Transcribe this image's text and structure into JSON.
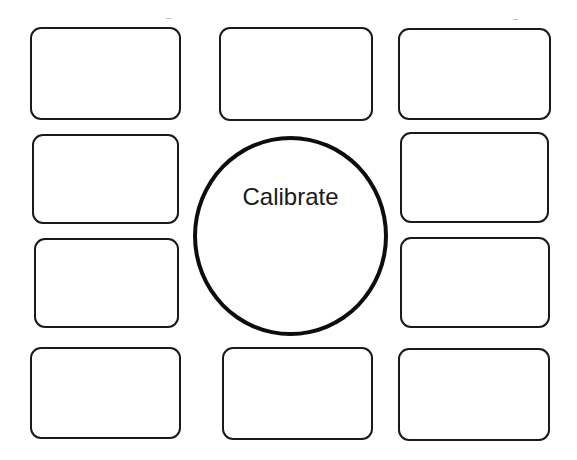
{
  "diagram": {
    "center": {
      "label": "Calibrate",
      "shape": "circle"
    },
    "boxes": [
      {
        "id": "top-left",
        "label": ""
      },
      {
        "id": "top-center",
        "label": ""
      },
      {
        "id": "top-right",
        "label": ""
      },
      {
        "id": "mid-upper-left",
        "label": ""
      },
      {
        "id": "mid-upper-right",
        "label": ""
      },
      {
        "id": "mid-lower-left",
        "label": ""
      },
      {
        "id": "mid-lower-right",
        "label": ""
      },
      {
        "id": "bottom-left",
        "label": ""
      },
      {
        "id": "bottom-center",
        "label": ""
      },
      {
        "id": "bottom-right",
        "label": ""
      }
    ],
    "colors": {
      "stroke": "#1a1a1a",
      "background": "#ffffff"
    }
  }
}
